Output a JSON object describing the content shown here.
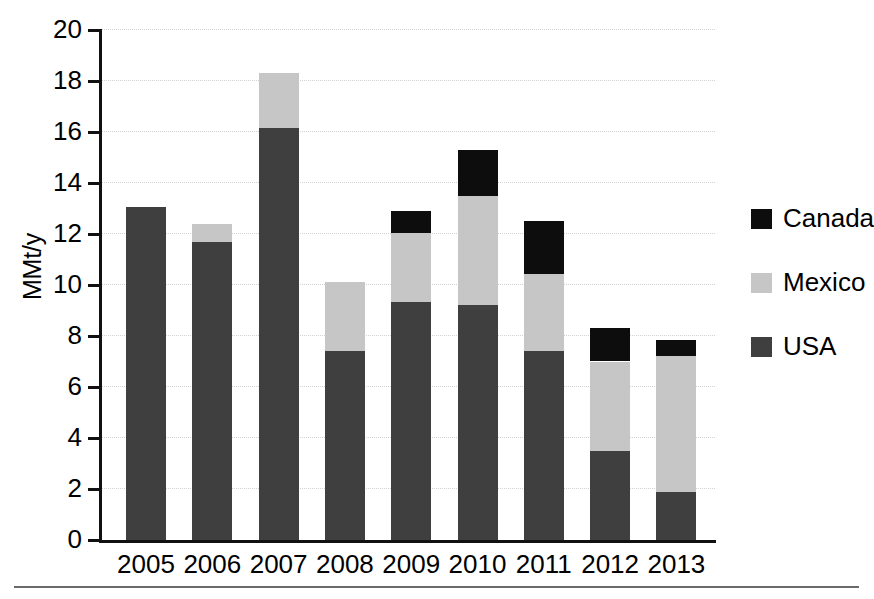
{
  "chart_data": {
    "type": "bar",
    "stacked": true,
    "title": "",
    "subtitle": "",
    "xlabel": "",
    "ylabel": "MMt/y",
    "categories": [
      "2005",
      "2006",
      "2007",
      "2008",
      "2009",
      "2010",
      "2011",
      "2012",
      "2013"
    ],
    "series": [
      {
        "name": "USA",
        "color": "#3f3f3f",
        "values": [
          13.05,
          11.7,
          16.15,
          7.4,
          9.35,
          9.2,
          7.4,
          3.5,
          1.9
        ]
      },
      {
        "name": "Mexico",
        "color": "#c6c6c6",
        "values": [
          0.0,
          0.7,
          2.15,
          2.7,
          2.7,
          4.3,
          3.05,
          3.5,
          5.3
        ]
      },
      {
        "name": "Canada",
        "color": "#0d0d0d",
        "values": [
          0.0,
          0.0,
          0.0,
          0.0,
          0.85,
          1.8,
          2.05,
          1.3,
          0.65
        ]
      }
    ],
    "totals": [
      13.05,
      12.4,
      18.3,
      10.1,
      12.9,
      15.3,
      12.5,
      8.3,
      7.85
    ],
    "ylim": [
      0,
      20
    ],
    "yticks": [
      0,
      2,
      4,
      6,
      8,
      10,
      12,
      14,
      16,
      18,
      20
    ],
    "ytick_labels": [
      "0",
      "2",
      "4",
      "6",
      "8",
      "10",
      "12",
      "14",
      "16",
      "18",
      "20"
    ],
    "grid": true,
    "grid_axis": "y",
    "legend_position": "right",
    "legend_entries": [
      {
        "label": "Canada",
        "color": "#0d0d0d"
      },
      {
        "label": "Mexico",
        "color": "#c6c6c6"
      },
      {
        "label": "USA",
        "color": "#3f3f3f"
      }
    ]
  },
  "colors": {
    "usa": "#3f3f3f",
    "mexico": "#c6c6c6",
    "canada": "#0d0d0d",
    "axis": "#111111",
    "grid": "#d2d2d2",
    "rule": "#6a6a6a",
    "background": "#ffffff"
  }
}
